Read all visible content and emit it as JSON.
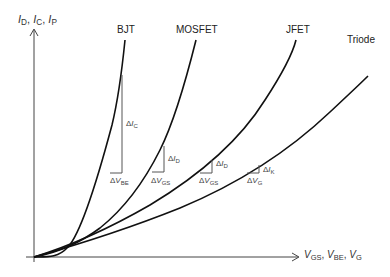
{
  "diagram": {
    "y_axis_label": {
      "parts": [
        {
          "sym": "I",
          "sub": "D"
        },
        {
          "sym": "I",
          "sub": "C"
        },
        {
          "sym": "I",
          "sub": "P"
        }
      ],
      "separator": ", "
    },
    "x_axis_label": {
      "parts": [
        {
          "sym": "V",
          "sub": "GS"
        },
        {
          "sym": "V",
          "sub": "BE"
        },
        {
          "sym": "V",
          "sub": "G"
        }
      ],
      "separator": ", "
    },
    "curves": [
      {
        "name": "BJT",
        "label": "BJT"
      },
      {
        "name": "MOSFET",
        "label": "MOSFET"
      },
      {
        "name": "JFET",
        "label": "JFET"
      },
      {
        "name": "Triode",
        "label": "Triode"
      }
    ],
    "triangles": [
      {
        "curve": "BJT",
        "dy_label": {
          "delta": "Δ",
          "sym": "I",
          "sub": "C"
        },
        "dx_label": {
          "delta": "Δ",
          "sym": "V",
          "sub": "BE"
        }
      },
      {
        "curve": "MOSFET",
        "dy_label": {
          "delta": "Δ",
          "sym": "I",
          "sub": "D"
        },
        "dx_label": {
          "delta": "Δ",
          "sym": "V",
          "sub": "GS"
        }
      },
      {
        "curve": "JFET",
        "dy_label": {
          "delta": "Δ",
          "sym": "I",
          "sub": "D"
        },
        "dx_label": {
          "delta": "Δ",
          "sym": "V",
          "sub": "GS"
        }
      },
      {
        "curve": "Triode",
        "dy_label": {
          "delta": "Δ",
          "sym": "I",
          "sub": "K"
        },
        "dx_label": {
          "delta": "Δ",
          "sym": "V",
          "sub": "G"
        }
      }
    ]
  }
}
